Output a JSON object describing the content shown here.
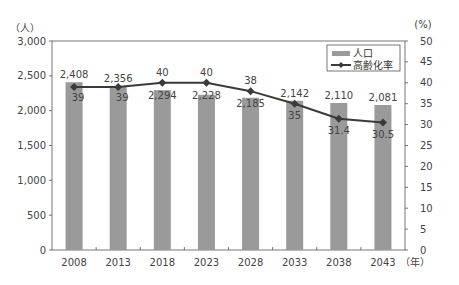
{
  "chart_data": {
    "type": "bar+line",
    "title": "",
    "categories": [
      "2008",
      "2013",
      "2018",
      "2023",
      "2028",
      "2033",
      "2038",
      "2043"
    ],
    "series": [
      {
        "name": "人口",
        "type": "bar",
        "axis": "left",
        "color": "#9a9a9a",
        "values": [
          2408,
          2356,
          2294,
          2228,
          2185,
          2142,
          2110,
          2081
        ]
      },
      {
        "name": "高齢化率",
        "type": "line",
        "axis": "right",
        "color": "#3a3a3a",
        "values": [
          39,
          39,
          40,
          40,
          38,
          35,
          31.4,
          30.5
        ]
      }
    ],
    "left_axis": {
      "unit_label": "（人）",
      "ylim": [
        0,
        3000
      ],
      "ticks": [
        "0",
        "500",
        "1,000",
        "1,500",
        "2,000",
        "2,500",
        "3,000"
      ]
    },
    "right_axis": {
      "unit_label": "(%)",
      "ylim": [
        0,
        50
      ],
      "ticks": [
        "0",
        "5",
        "10",
        "15",
        "20",
        "25",
        "30",
        "35",
        "40",
        "45",
        "50"
      ]
    },
    "x_unit_label": "（年）",
    "bar_labels": [
      "2,408",
      "2,356",
      "2,294",
      "2,228",
      "2,185",
      "2,142",
      "2,110",
      "2,081"
    ],
    "line_labels": [
      "39",
      "39",
      "40",
      "40",
      "38",
      "35",
      "31.4",
      "30.5"
    ],
    "legend": {
      "position": "top-right",
      "entries": [
        "人口",
        "高齢化率"
      ]
    },
    "grid": false
  }
}
